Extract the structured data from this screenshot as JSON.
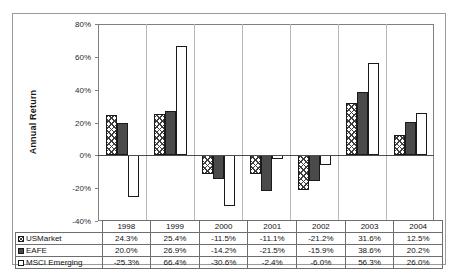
{
  "chart_data": {
    "type": "bar",
    "title": "",
    "xlabel": "",
    "ylabel": "Annual Return",
    "ylim": [
      -40,
      80
    ],
    "ytick_labels": [
      "80%",
      "60%",
      "40%",
      "20%",
      "0%",
      "-20%",
      "-40%"
    ],
    "ytick_values": [
      80,
      60,
      40,
      20,
      0,
      -20,
      -40
    ],
    "grid": false,
    "legend_position": "table-row-labels",
    "categories": [
      "1998",
      "1999",
      "2000",
      "2001",
      "2002",
      "2003",
      "2004"
    ],
    "series": [
      {
        "name": "USMarket",
        "pattern": "cross-hatch",
        "values": [
          24.3,
          25.4,
          -11.5,
          -11.1,
          -21.2,
          31.6,
          12.5
        ],
        "labels": [
          "24.3%",
          "25.4%",
          "-11.5%",
          "-11.1%",
          "-21.2%",
          "31.6%",
          "12.5%"
        ]
      },
      {
        "name": "EAFE",
        "pattern": "solid-dark",
        "values": [
          20.0,
          26.9,
          -14.2,
          -21.5,
          -15.9,
          38.6,
          20.2
        ],
        "labels": [
          "20.0%",
          "26.9%",
          "-14.2%",
          "-21.5%",
          "-15.9%",
          "38.6%",
          "20.2%"
        ]
      },
      {
        "name": "MSCI Emerging",
        "pattern": "white-outline",
        "values": [
          -25.3,
          66.4,
          -30.6,
          -2.4,
          -6.0,
          56.3,
          26.0
        ],
        "labels": [
          "-25.3%",
          "66.4%",
          "-30.6%",
          "-2.4%",
          "-6.0%",
          "56.3%",
          "26.0%"
        ]
      }
    ]
  },
  "colors": {
    "series_solid": "#4a4a4a",
    "series_hatch": "#3d3d3d",
    "series_white": "#ffffff",
    "axis": "#808080",
    "border": "#9a9a9a"
  }
}
